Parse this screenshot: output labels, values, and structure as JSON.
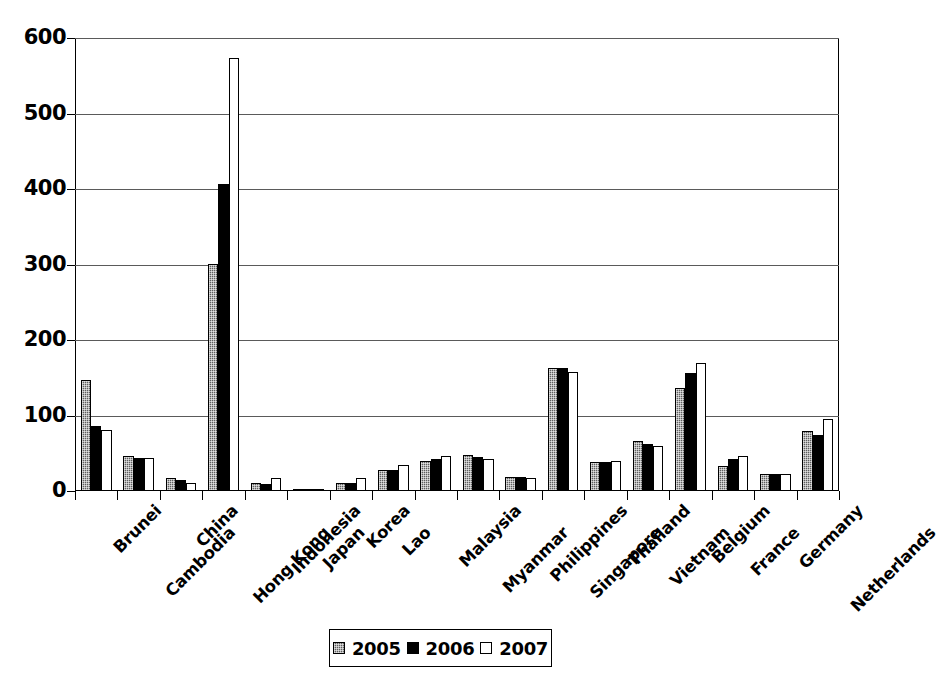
{
  "chart_data": {
    "type": "bar",
    "title": "",
    "subtitle": "",
    "xlabel": "",
    "ylabel": "",
    "ylim": [
      0,
      600
    ],
    "yticks": [
      0,
      100,
      200,
      300,
      400,
      500,
      600
    ],
    "ytick_labels": [
      "0",
      "100",
      "200",
      "300",
      "400",
      "500",
      "600"
    ],
    "grid": "horizontal",
    "legend_position": "bottom-center",
    "categories": [
      "Brunei",
      "Cambodia",
      "China",
      "Hong Kong",
      "Indonesia",
      "Japan",
      "Korea",
      "Lao",
      "Malaysia",
      "Myanmar",
      "Philippines",
      "Singapore",
      "Thailand",
      "Vietnam",
      "Belgium",
      "France",
      "Germany",
      "Netherlands"
    ],
    "series": [
      {
        "name": "2005",
        "color": "#5f5f5f",
        "pattern": "dotted-gray",
        "values": [
          147,
          47,
          17,
          301,
          10,
          3,
          11,
          28,
          40,
          48,
          18,
          163,
          38,
          66,
          136,
          33,
          23,
          80
        ]
      },
      {
        "name": "2006",
        "color": "#000000",
        "pattern": "solid-black",
        "values": [
          86,
          44,
          14,
          407,
          9,
          3,
          11,
          28,
          42,
          45,
          18,
          163,
          38,
          62,
          156,
          43,
          23,
          74
        ]
      },
      {
        "name": "2007",
        "color": "#ffffff",
        "pattern": "white-outline",
        "values": [
          81,
          44,
          11,
          574,
          17,
          3,
          17,
          34,
          47,
          43,
          17,
          158,
          40,
          60,
          170,
          46,
          23,
          95
        ]
      }
    ]
  },
  "legend": {
    "entries": [
      {
        "label": "2005",
        "swatch": "legend-swatch-2005"
      },
      {
        "label": "2006",
        "swatch": "legend-swatch-2006"
      },
      {
        "label": "2007",
        "swatch": "legend-swatch-2007"
      }
    ]
  }
}
